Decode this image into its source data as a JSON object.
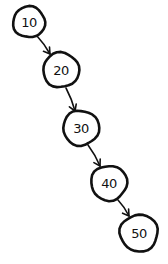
{
  "diagram": {
    "type": "binary-search-tree",
    "nodes": [
      {
        "id": "n10",
        "label": "10",
        "cx": 29,
        "cy": 22,
        "r": 16
      },
      {
        "id": "n20",
        "label": "20",
        "cx": 61,
        "cy": 70,
        "r": 18
      },
      {
        "id": "n30",
        "label": "30",
        "cx": 81,
        "cy": 128,
        "r": 18
      },
      {
        "id": "n40",
        "label": "40",
        "cx": 109,
        "cy": 183,
        "r": 18
      },
      {
        "id": "n50",
        "label": "50",
        "cx": 139,
        "cy": 233,
        "r": 19
      }
    ],
    "edges": [
      {
        "from": "10",
        "to": "20",
        "x1": 37,
        "y1": 36,
        "x2": 50,
        "y2": 54
      },
      {
        "from": "20",
        "to": "30",
        "x1": 66,
        "y1": 88,
        "x2": 75,
        "y2": 111
      },
      {
        "from": "30",
        "to": "40",
        "x1": 88,
        "y1": 145,
        "x2": 100,
        "y2": 166
      },
      {
        "from": "40",
        "to": "50",
        "x1": 118,
        "y1": 200,
        "x2": 129,
        "y2": 216
      }
    ],
    "colors": {
      "stroke": "#111111",
      "background": "#ffffff"
    }
  }
}
